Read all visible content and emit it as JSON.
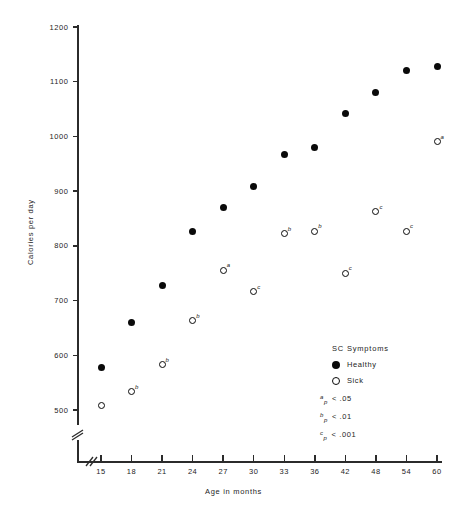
{
  "chart_data": {
    "type": "scatter",
    "title": "",
    "xlabel": "Age in months",
    "ylabel": "Calories per day",
    "xlim": [
      13,
      62
    ],
    "ylim": [
      480,
      1200
    ],
    "grid": false,
    "axis_break_x": true,
    "axis_break_y": true,
    "x_ticks": [
      15,
      18,
      21,
      24,
      27,
      30,
      33,
      36,
      42,
      48,
      54,
      60
    ],
    "y_ticks": [
      500,
      600,
      700,
      800,
      900,
      1000,
      1100,
      1200
    ],
    "legend_position": "bottom-right",
    "series": [
      {
        "name": "Healthy",
        "marker": "filled-circle",
        "x": [
          15,
          18,
          21,
          24,
          27,
          30,
          33,
          36,
          42,
          48,
          54,
          60
        ],
        "values": [
          577,
          660,
          727,
          827,
          870,
          908,
          967,
          980,
          1042,
          1080,
          1120,
          1127
        ],
        "annotations": [
          "",
          "",
          "",
          "",
          "",
          "",
          "",
          "",
          "",
          "",
          "",
          ""
        ]
      },
      {
        "name": "Sick",
        "marker": "open-circle",
        "x": [
          15,
          18,
          21,
          24,
          27,
          30,
          33,
          36,
          42,
          48,
          54,
          60
        ],
        "values": [
          508,
          533,
          583,
          663,
          755,
          716,
          822,
          827,
          750,
          862,
          827,
          990
        ],
        "annotations": [
          "",
          "b",
          "b",
          "b",
          "a",
          "c",
          "b",
          "b",
          "c",
          "c",
          "c",
          "a"
        ]
      }
    ]
  },
  "axes": {
    "y_label": "Calories per day",
    "x_label": "Age in months",
    "y_tick_labels": [
      "1200",
      "1100",
      "1000",
      "900",
      "800",
      "700",
      "600",
      "500"
    ],
    "x_tick_labels": [
      "15",
      "18",
      "21",
      "24",
      "27",
      "30",
      "33",
      "36",
      "42",
      "48",
      "54",
      "60"
    ]
  },
  "legend": {
    "title": "SC Symptoms",
    "entries": [
      {
        "label": "Healthy",
        "marker": "filled-circle"
      },
      {
        "label": "Sick",
        "marker": "open-circle"
      }
    ],
    "notes": [
      {
        "sup": "a",
        "sub": "p",
        "text": "< .05"
      },
      {
        "sup": "b",
        "sub": "p",
        "text": "< .01"
      },
      {
        "sup": "c",
        "sub": "p",
        "text": "< .001"
      }
    ]
  },
  "colors": {
    "marker": "#0a0a0a",
    "axis": "#2b2b2b",
    "text": "#242424",
    "background": "#ffffff"
  }
}
